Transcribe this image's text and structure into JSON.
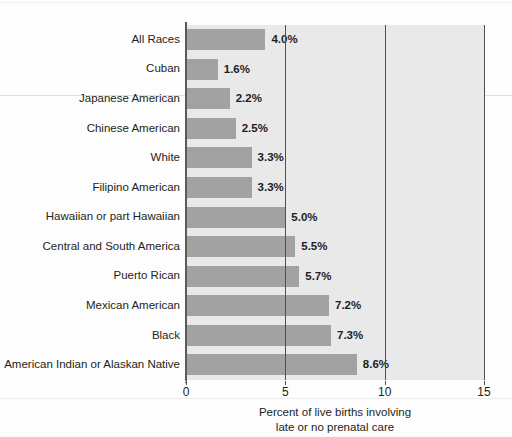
{
  "chart_data": {
    "type": "bar",
    "orientation": "horizontal",
    "title": "",
    "xlabel": "Percent of live births involving late or no prenatal care",
    "xlabel_line1": "Percent of live births involving",
    "xlabel_line2": "late or no prenatal care",
    "ylabel": "",
    "xlim": [
      0,
      15
    ],
    "xticks": [
      0,
      5,
      10,
      15
    ],
    "xtick_labels": [
      "0",
      "5",
      "10",
      "15"
    ],
    "grid": "vertical-only",
    "legend": "none",
    "value_suffix": "%",
    "categories": [
      "All Races",
      "Cuban",
      "Japanese American",
      "Chinese American",
      "White",
      "Filipino American",
      "Hawaiian or part Hawaiian",
      "Central and South America",
      "Puerto Rican",
      "Mexican American",
      "Black",
      "American Indian or Alaskan Native"
    ],
    "values": [
      4.0,
      1.6,
      2.2,
      2.5,
      3.3,
      3.3,
      5.0,
      5.5,
      5.7,
      7.2,
      7.3,
      8.6
    ],
    "value_labels": [
      "4.0%",
      "1.6%",
      "2.2%",
      "2.5%",
      "3.3%",
      "3.3%",
      "5.0%",
      "5.5%",
      "5.7%",
      "7.2%",
      "7.3%",
      "8.6%"
    ],
    "colors": {
      "bar": "#a2a2a2",
      "plot_background": "#e9e9e9",
      "page_background": "#ffffff",
      "gridline": "#4f4f4f",
      "axis": "#5a5a5a",
      "text": "#231f20"
    }
  }
}
